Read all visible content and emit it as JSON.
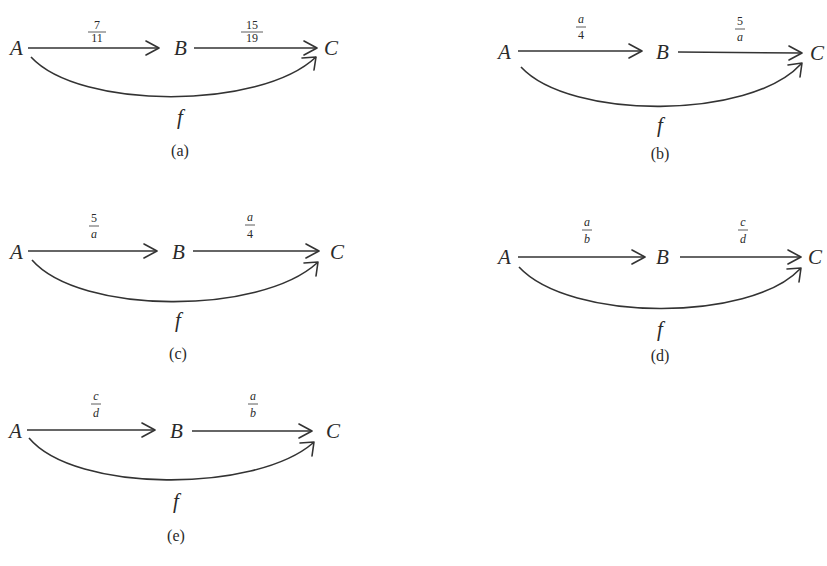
{
  "diagrams": {
    "a": {
      "nodes": {
        "A": "A",
        "B": "B",
        "C": "C"
      },
      "edge_ab": {
        "num": "7",
        "den": "11",
        "italic": false
      },
      "edge_bc": {
        "num": "15",
        "den": "19",
        "italic": false
      },
      "edge_ac_label": "f",
      "caption": "(a)"
    },
    "b": {
      "nodes": {
        "A": "A",
        "B": "B",
        "C": "C"
      },
      "edge_ab": {
        "num": "a",
        "den": "4"
      },
      "edge_bc": {
        "num": "5",
        "den": "a"
      },
      "edge_ac_label": "f",
      "caption": "(b)"
    },
    "c": {
      "nodes": {
        "A": "A",
        "B": "B",
        "C": "C"
      },
      "edge_ab": {
        "num": "5",
        "den": "a"
      },
      "edge_bc": {
        "num": "a",
        "den": "4"
      },
      "edge_ac_label": "f",
      "caption": "(c)"
    },
    "d": {
      "nodes": {
        "A": "A",
        "B": "B",
        "C": "C"
      },
      "edge_ab": {
        "num": "a",
        "den": "b"
      },
      "edge_bc": {
        "num": "c",
        "den": "d"
      },
      "edge_ac_label": "f",
      "caption": "(d)"
    },
    "e": {
      "nodes": {
        "A": "A",
        "B": "B",
        "C": "C"
      },
      "edge_ab": {
        "num": "c",
        "den": "d"
      },
      "edge_bc": {
        "num": "a",
        "den": "b"
      },
      "edge_ac_label": "f",
      "caption": "(e)"
    }
  }
}
